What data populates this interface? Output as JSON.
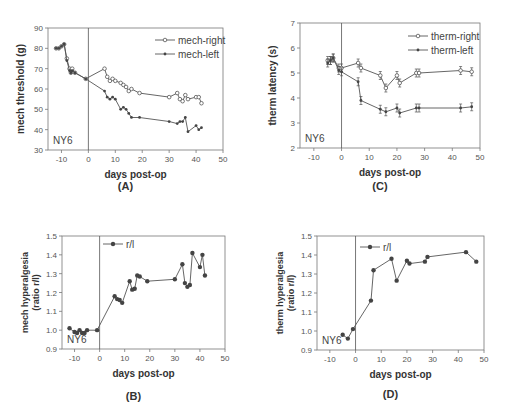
{
  "chart_data": [
    {
      "id": "A",
      "type": "line",
      "panel_label": "(A)",
      "xlabel": "days post-op",
      "ylabel": "mech threshold (g)",
      "xlim": [
        -15,
        50
      ],
      "ylim": [
        30,
        90
      ],
      "xticks": [
        -10,
        0,
        10,
        20,
        30,
        40,
        50
      ],
      "yticks": [
        30,
        40,
        50,
        60,
        70,
        80,
        90
      ],
      "annotation": "NY6",
      "vline_x": 0,
      "legend_position": "top-right",
      "series": [
        {
          "name": "mech-right",
          "marker": "open-circle",
          "points": [
            [
              -12,
              80
            ],
            [
              -11,
              80
            ],
            [
              -10,
              81
            ],
            [
              -9,
              82
            ],
            [
              -8,
              75
            ],
            [
              -7,
              70
            ],
            [
              -6.5,
              68
            ],
            [
              -6,
              70
            ],
            [
              -5,
              68
            ],
            [
              -1,
              65
            ],
            [
              6,
              70
            ],
            [
              7,
              66
            ],
            [
              8,
              64
            ],
            [
              9,
              65
            ],
            [
              10,
              64
            ],
            [
              12,
              63
            ],
            [
              13,
              62
            ],
            [
              14,
              61
            ],
            [
              15,
              59
            ],
            [
              16,
              60
            ],
            [
              19,
              58
            ],
            [
              30,
              56
            ],
            [
              33,
              58
            ],
            [
              34,
              55
            ],
            [
              35,
              54
            ],
            [
              36,
              57
            ],
            [
              37,
              55
            ],
            [
              40,
              56
            ],
            [
              41,
              56
            ],
            [
              42,
              53
            ]
          ]
        },
        {
          "name": "mech-left",
          "marker": "filled-circle",
          "points": [
            [
              -12,
              80
            ],
            [
              -11,
              80
            ],
            [
              -10,
              81
            ],
            [
              -9,
              82
            ],
            [
              -8,
              74
            ],
            [
              -7,
              69
            ],
            [
              -6.5,
              68
            ],
            [
              -6,
              69
            ],
            [
              -5,
              68
            ],
            [
              -1,
              65
            ],
            [
              6,
              59
            ],
            [
              7,
              56
            ],
            [
              8,
              55
            ],
            [
              9,
              56
            ],
            [
              10,
              55
            ],
            [
              12,
              50
            ],
            [
              13,
              51
            ],
            [
              14,
              50
            ],
            [
              15,
              48
            ],
            [
              16,
              46
            ],
            [
              19,
              46
            ],
            [
              30,
              44
            ],
            [
              33,
              43
            ],
            [
              34,
              44
            ],
            [
              35,
              44
            ],
            [
              36,
              46
            ],
            [
              37,
              39
            ],
            [
              40,
              42
            ],
            [
              41,
              40
            ],
            [
              42,
              41
            ]
          ]
        }
      ]
    },
    {
      "id": "C",
      "type": "line",
      "panel_label": "(C)",
      "xlabel": "days post-op",
      "ylabel": "therm latency (s)",
      "xlim": [
        -15,
        50
      ],
      "ylim": [
        2,
        7
      ],
      "xticks": [
        -10,
        0,
        10,
        20,
        30,
        40,
        50
      ],
      "yticks": [
        2,
        3,
        4,
        5,
        6,
        7
      ],
      "annotation": "NY6",
      "vline_x": 0,
      "legend_position": "top-right",
      "series": [
        {
          "name": "therm-right",
          "marker": "open-circle",
          "points": [
            [
              -5,
              5.5
            ],
            [
              -4,
              5.5
            ],
            [
              -3,
              5.6
            ],
            [
              -1,
              5.2
            ],
            [
              0,
              5.2
            ],
            [
              6,
              5.4
            ],
            [
              7,
              5.2
            ],
            [
              14,
              4.9
            ],
            [
              16,
              4.4
            ],
            [
              20,
              4.9
            ],
            [
              21,
              4.6
            ],
            [
              27,
              5.0
            ],
            [
              28,
              5.0
            ],
            [
              43,
              5.1
            ],
            [
              47,
              5.05
            ]
          ]
        },
        {
          "name": "therm-left",
          "marker": "filled-circle",
          "points": [
            [
              -5,
              5.4
            ],
            [
              -4,
              5.5
            ],
            [
              -3,
              5.6
            ],
            [
              -1,
              5.1
            ],
            [
              0,
              5.05
            ],
            [
              6,
              4.65
            ],
            [
              7,
              3.9
            ],
            [
              14,
              3.55
            ],
            [
              16,
              3.45
            ],
            [
              20,
              3.6
            ],
            [
              21,
              3.4
            ],
            [
              27,
              3.6
            ],
            [
              28,
              3.6
            ],
            [
              43,
              3.6
            ],
            [
              47,
              3.65
            ]
          ]
        }
      ]
    },
    {
      "id": "B",
      "type": "line",
      "panel_label": "(B)",
      "xlabel": "days post-op",
      "ylabel": "mech hyperalgesia",
      "ylabel2": "(ratio r/l)",
      "xlim": [
        -15,
        50
      ],
      "ylim": [
        0.9,
        1.5
      ],
      "xticks": [
        -10,
        0,
        10,
        20,
        30,
        40,
        50
      ],
      "yticks": [
        0.9,
        1.0,
        1.1,
        1.2,
        1.3,
        1.4,
        1.5
      ],
      "annotation": "NY6",
      "vline_x": 0,
      "legend_position": "top-left",
      "series": [
        {
          "name": "r/l",
          "marker": "filled-circle",
          "points": [
            [
              -12,
              1.01
            ],
            [
              -10,
              0.99
            ],
            [
              -9,
              0.985
            ],
            [
              -8,
              1.0
            ],
            [
              -7,
              0.985
            ],
            [
              -6,
              0.985
            ],
            [
              -5,
              1.0
            ],
            [
              -1,
              1.0
            ],
            [
              6,
              1.18
            ],
            [
              7,
              1.165
            ],
            [
              8,
              1.16
            ],
            [
              9,
              1.145
            ],
            [
              12,
              1.26
            ],
            [
              13,
              1.215
            ],
            [
              14,
              1.22
            ],
            [
              15,
              1.29
            ],
            [
              16,
              1.285
            ],
            [
              19,
              1.26
            ],
            [
              30,
              1.27
            ],
            [
              33,
              1.35
            ],
            [
              34,
              1.25
            ],
            [
              35,
              1.23
            ],
            [
              36,
              1.24
            ],
            [
              37,
              1.41
            ],
            [
              40,
              1.335
            ],
            [
              41,
              1.4
            ],
            [
              42,
              1.29
            ]
          ]
        }
      ]
    },
    {
      "id": "D",
      "type": "line",
      "panel_label": "(D)",
      "xlabel": "days post-op",
      "ylabel": "therm hyperalgesia",
      "ylabel2": "(ratio r/l)",
      "xlim": [
        -15,
        50
      ],
      "ylim": [
        0.9,
        1.5
      ],
      "xticks": [
        -10,
        0,
        10,
        20,
        30,
        40,
        50
      ],
      "yticks": [
        0.9,
        1.0,
        1.1,
        1.2,
        1.3,
        1.4,
        1.5
      ],
      "annotation": "NY6",
      "vline_x": 0,
      "legend_position": "top-left",
      "series": [
        {
          "name": "r/l",
          "marker": "filled-circle",
          "points": [
            [
              -5,
              0.98
            ],
            [
              -3,
              0.96
            ],
            [
              -1,
              1.01
            ],
            [
              6,
              1.16
            ],
            [
              7,
              1.32
            ],
            [
              14,
              1.38
            ],
            [
              16,
              1.265
            ],
            [
              20,
              1.37
            ],
            [
              21,
              1.355
            ],
            [
              27,
              1.365
            ],
            [
              28,
              1.39
            ],
            [
              43,
              1.415
            ],
            [
              47,
              1.365
            ]
          ]
        }
      ]
    }
  ]
}
